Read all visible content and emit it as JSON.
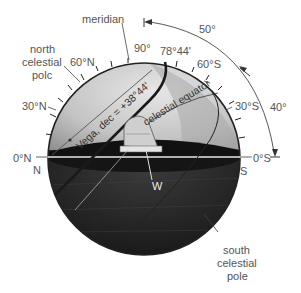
{
  "labels": {
    "meridian": "meridian",
    "north_celestial_pole": [
      "north",
      "celestial",
      "polc"
    ],
    "south_celestial_pole": [
      "south",
      "celestial",
      "pole"
    ],
    "celestial_equator": "celestial equator",
    "vega_dec": "Vega, dec = +38°44'",
    "zenith_angle": "90°",
    "vega_altitude": "78°44'",
    "n60": "60°N",
    "n30": "30°N",
    "n0": "0°N",
    "s60": "60°S",
    "s30": "30°S",
    "s0": "0°S",
    "north": "N",
    "south": "S",
    "west": "W",
    "arc_upper": "50°",
    "arc_lower": "40°"
  },
  "colors": {
    "sky_light": "#d8d8d8",
    "sky_mid": "#a9a9a9",
    "ground_dark": "#1c1c1c",
    "outline": "#2a2a2a",
    "text": "#555555"
  }
}
